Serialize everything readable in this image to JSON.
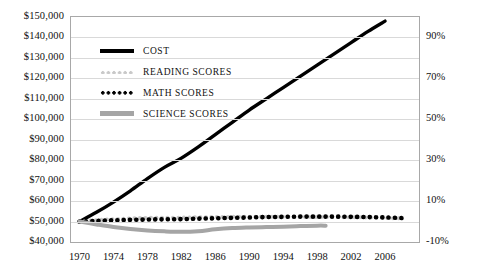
{
  "chart_data": {
    "type": "line",
    "title": "",
    "xlabel": "",
    "ylabel": "",
    "grid": true,
    "legend_position": "top-left-inside",
    "x": [
      1970,
      1971,
      1972,
      1973,
      1974,
      1975,
      1976,
      1977,
      1978,
      1979,
      1980,
      1981,
      1982,
      1983,
      1984,
      1985,
      1986,
      1987,
      1988,
      1989,
      1990,
      1991,
      1992,
      1993,
      1994,
      1995,
      1996,
      1997,
      1998,
      1999,
      2000,
      2001,
      2002,
      2003,
      2004,
      2005,
      2006,
      2007,
      2008,
      2009
    ],
    "xlim": [
      1969,
      2010
    ],
    "xticks": [
      1970,
      1974,
      1978,
      1982,
      1986,
      1990,
      1994,
      1998,
      2002,
      2006
    ],
    "xticklabels": [
      "1970",
      "1974",
      "1978",
      "1982",
      "1986",
      "1990",
      "1994",
      "1998",
      "2002",
      "2006"
    ],
    "ylim": [
      40000,
      150000
    ],
    "yticks": [
      40000,
      50000,
      60000,
      70000,
      80000,
      90000,
      100000,
      110000,
      120000,
      130000,
      140000,
      150000
    ],
    "yticklabels": [
      "$40,000",
      "$50,000",
      "$60,000",
      "$70,000",
      "$80,000",
      "$90,000",
      "$100,000",
      "$110,000",
      "$120,000",
      "$130,000",
      "$140,000",
      "$150,000"
    ],
    "y2lim": [
      -10,
      100
    ],
    "y2ticks": [
      -10,
      10,
      30,
      50,
      70,
      90
    ],
    "y2ticklabels": [
      "-10%",
      "10%",
      "30%",
      "50%",
      "70%",
      "90%"
    ],
    "series": [
      {
        "name": "COST",
        "color": "#000000",
        "style": "solid",
        "width": 3.4,
        "x": [
          1970,
          1972,
          1974,
          1976,
          1978,
          1980,
          1982,
          1984,
          1986,
          1988,
          1990,
          1992,
          1994,
          1996,
          1998,
          2000,
          2002,
          2004,
          2006
        ],
        "values": [
          50000,
          54500,
          59500,
          65000,
          71000,
          76500,
          81000,
          86500,
          92500,
          98500,
          104500,
          110000,
          115500,
          121000,
          126500,
          132000,
          137500,
          143000,
          148000
        ]
      },
      {
        "name": "READING SCORES",
        "color": "#c9c9c9",
        "style": "dotted",
        "width": 4,
        "x": [
          1970,
          1972,
          1974,
          1976,
          1978,
          1980,
          1982,
          1984,
          1986,
          1988,
          1990,
          1992,
          1994,
          1996,
          1998,
          2000,
          2002,
          2004,
          2006,
          2008
        ],
        "values": [
          50000,
          50700,
          51200,
          51500,
          51800,
          51900,
          51900,
          52100,
          52200,
          52300,
          52300,
          52400,
          52300,
          52300,
          52200,
          52200,
          52100,
          52000,
          51800,
          51500
        ]
      },
      {
        "name": "MATH SCORES",
        "color": "#000000",
        "style": "dotted",
        "width": 4.6,
        "x": [
          1970,
          1972,
          1974,
          1976,
          1978,
          1980,
          1982,
          1984,
          1986,
          1988,
          1990,
          1992,
          1994,
          1996,
          1998,
          2000,
          2002,
          2004,
          2006,
          2008
        ],
        "values": [
          50000,
          50300,
          50600,
          50800,
          51000,
          51100,
          51200,
          51400,
          51600,
          51800,
          52000,
          52200,
          52300,
          52400,
          52400,
          52400,
          52300,
          52200,
          52000,
          51700
        ]
      },
      {
        "name": "SCIENCE SCORES",
        "color": "#a5a5a5",
        "style": "solid",
        "width": 4,
        "x": [
          1970,
          1972,
          1974,
          1976,
          1978,
          1980,
          1982,
          1984,
          1986,
          1988,
          1990,
          1992,
          1994,
          1996,
          1998,
          1999
        ],
        "values": [
          50000,
          48600,
          47300,
          46300,
          45600,
          45200,
          45000,
          45300,
          46200,
          46800,
          47100,
          47300,
          47500,
          47800,
          48000,
          48000
        ]
      }
    ]
  },
  "legend": {
    "items": [
      {
        "label": "COST",
        "key": "cost"
      },
      {
        "label": "READING SCORES",
        "key": "reading"
      },
      {
        "label": "MATH SCORES",
        "key": "math"
      },
      {
        "label": "SCIENCE SCORES",
        "key": "science"
      }
    ]
  }
}
